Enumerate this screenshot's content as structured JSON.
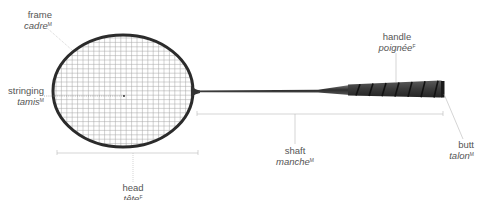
{
  "diagram": {
    "colors": {
      "frame": "#2b2b2b",
      "strings": "#9a9a9a",
      "shaft": "#3a3a3a",
      "grip": "#3c3c3c",
      "grip_wrap": "#151515",
      "leader_lines": "#b5b5b5",
      "label_text": "#555555"
    },
    "labels": [
      {
        "id": "frame",
        "en": "frame",
        "fr": "cadre",
        "gender": "M"
      },
      {
        "id": "stringing",
        "en": "stringing",
        "fr": "tamis",
        "gender": "M"
      },
      {
        "id": "head",
        "en": "head",
        "fr": "tête",
        "gender": "F"
      },
      {
        "id": "shaft",
        "en": "shaft",
        "fr": "manche",
        "gender": "M"
      },
      {
        "id": "handle",
        "en": "handle",
        "fr": "poignée",
        "gender": "F"
      },
      {
        "id": "butt",
        "en": "butt",
        "fr": "talon",
        "gender": "M"
      }
    ]
  }
}
